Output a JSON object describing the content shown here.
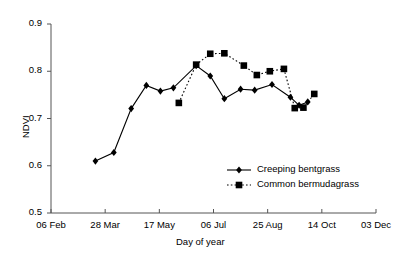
{
  "chart_data": {
    "type": "line",
    "title": "",
    "xlabel": "Day of year",
    "ylabel": "NDVI",
    "ylim": [
      0.5,
      0.9
    ],
    "yticks": [
      0.5,
      0.6,
      0.7,
      0.8,
      0.9
    ],
    "ytick_labels": [
      "0.5",
      "0.6",
      "0.7",
      "0.8",
      "0.9"
    ],
    "xticks": [
      37,
      87,
      137,
      187,
      237,
      287,
      337
    ],
    "xtick_labels": [
      "06 Feb",
      "28 Mar",
      "17 May",
      "06 Jul",
      "25 Aug",
      "14 Oct",
      "03 Dec"
    ],
    "xlim": [
      37,
      337
    ],
    "grid": false,
    "legend_position": "inside-lower-right",
    "series": [
      {
        "name": "Creeping bentgrass",
        "marker": "diamond",
        "linestyle": "solid",
        "color": "#000000",
        "points": [
          {
            "x": 78,
            "y": 0.61
          },
          {
            "x": 95,
            "y": 0.628
          },
          {
            "x": 111,
            "y": 0.721
          },
          {
            "x": 125,
            "y": 0.77
          },
          {
            "x": 138,
            "y": 0.758
          },
          {
            "x": 150,
            "y": 0.765
          },
          {
            "x": 171,
            "y": 0.812
          },
          {
            "x": 184,
            "y": 0.79
          },
          {
            "x": 197,
            "y": 0.742
          },
          {
            "x": 212,
            "y": 0.762
          },
          {
            "x": 225,
            "y": 0.76
          },
          {
            "x": 241,
            "y": 0.772
          },
          {
            "x": 258,
            "y": 0.745
          },
          {
            "x": 266,
            "y": 0.728
          },
          {
            "x": 274,
            "y": 0.735
          }
        ]
      },
      {
        "name": "Common bermudagrass",
        "marker": "square",
        "linestyle": "dotted",
        "color": "#000000",
        "points": [
          {
            "x": 155,
            "y": 0.733
          },
          {
            "x": 171,
            "y": 0.814
          },
          {
            "x": 184,
            "y": 0.837
          },
          {
            "x": 197,
            "y": 0.838
          },
          {
            "x": 215,
            "y": 0.812
          },
          {
            "x": 227,
            "y": 0.792
          },
          {
            "x": 239,
            "y": 0.8
          },
          {
            "x": 252,
            "y": 0.805
          },
          {
            "x": 262,
            "y": 0.722
          },
          {
            "x": 270,
            "y": 0.723
          },
          {
            "x": 280,
            "y": 0.752
          }
        ]
      }
    ]
  },
  "legend": {
    "items": [
      {
        "label": "Creeping bentgrass",
        "marker": "diamond",
        "linestyle": "solid"
      },
      {
        "label": "Common bermudagrass",
        "marker": "square",
        "linestyle": "dotted"
      }
    ]
  },
  "colors": {
    "axis": "#555555",
    "series": "#000000",
    "background": "#ffffff"
  }
}
